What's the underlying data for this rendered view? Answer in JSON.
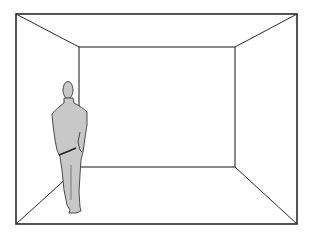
{
  "figure": {
    "description": "Perspective line drawing of an empty room with a standing man viewed from behind",
    "colors": {
      "background": "#ffffff",
      "line": "#2a2a2a",
      "figure_fill": "#c8c8c8",
      "figure_outline": "#3a3a3a"
    },
    "room": {
      "outer_rect": [
        16,
        14,
        297,
        224
      ],
      "back_wall_rect": [
        79,
        47,
        235,
        167
      ]
    },
    "person": {
      "pose": "standing, back to viewer, hands behind back",
      "position": "left side of room"
    }
  }
}
